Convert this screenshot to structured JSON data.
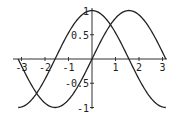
{
  "chart_data": {
    "type": "line",
    "title": "",
    "xlabel": "",
    "ylabel": "",
    "xlim": [
      -3.14159,
      3.14159
    ],
    "ylim": [
      -1,
      1
    ],
    "grid": false,
    "legend": null,
    "x_ticks": [
      "-3",
      "-2",
      "-1",
      "1",
      "2",
      "3"
    ],
    "y_ticks": [
      "-1",
      "-0.5",
      "0.5",
      "1"
    ],
    "series": [
      {
        "name": "sin(x)",
        "function": "sin(x)",
        "color": "#222222",
        "x": [
          -3.14,
          -2.36,
          -1.57,
          -0.79,
          0,
          0.79,
          1.57,
          2.36,
          3.14
        ],
        "values": [
          0,
          -0.71,
          -1,
          -0.71,
          0,
          0.71,
          1,
          0.71,
          0
        ]
      },
      {
        "name": "cos(x)",
        "function": "cos(x)",
        "color": "#222222",
        "x": [
          -3.14,
          -2.36,
          -1.57,
          -0.79,
          0,
          0.79,
          1.57,
          2.36,
          3.14
        ],
        "values": [
          -1,
          -0.71,
          0,
          0.71,
          1,
          0.71,
          0,
          -0.71,
          -1
        ]
      }
    ]
  },
  "layout": {
    "origin_x": 92,
    "origin_y": 59,
    "px_per_x": 23.5,
    "px_per_y": 48.5,
    "axis_x_start": 13,
    "axis_x_end": 167,
    "axis_y_top": 8,
    "axis_y_bottom": 109
  }
}
